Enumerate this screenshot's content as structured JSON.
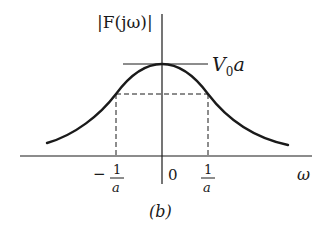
{
  "figure": {
    "caption": "(b)",
    "y_axis_label": "|F(jω)|",
    "x_axis_label": "ω",
    "peak_label": "V",
    "peak_label_sub": "0",
    "peak_label_tail": "a",
    "ticks": {
      "neg_sign": "−",
      "neg_num": "1",
      "neg_den": "a",
      "zero": "0",
      "pos_num": "1",
      "pos_den": "a"
    }
  }
}
